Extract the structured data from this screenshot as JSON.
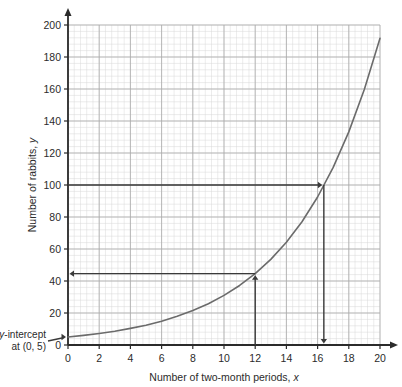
{
  "chart_data": {
    "type": "line",
    "title": "",
    "xlabel": "Number of two-month periods, x",
    "ylabel": "Number of rabbits, y",
    "xlim": [
      0,
      20
    ],
    "ylim": [
      0,
      200
    ],
    "grid": true,
    "minor_grid": true,
    "minor_divisions": 5,
    "legend": "none",
    "xticks": [
      0,
      2,
      4,
      6,
      8,
      10,
      12,
      14,
      16,
      18,
      20
    ],
    "yticks": [
      0,
      20,
      40,
      60,
      80,
      100,
      120,
      140,
      160,
      180,
      200
    ],
    "curve_color": "#6b6b6b",
    "annotation_color": "#3a3a3a",
    "series": [
      {
        "name": "Rabbit population",
        "equation": "y = 5(1.2)^x",
        "x": [
          0,
          1,
          2,
          3,
          4,
          5,
          6,
          7,
          8,
          9,
          10,
          11,
          12,
          13,
          14,
          15,
          16,
          17,
          18,
          19,
          20
        ],
        "values": [
          5,
          6,
          7.2,
          8.6,
          10.4,
          12.4,
          14.9,
          17.9,
          21.5,
          25.8,
          31,
          37.2,
          44.6,
          53.5,
          64.2,
          77,
          92.5,
          111,
          133.2,
          159.8,
          191.7
        ]
      }
    ],
    "annotations": [
      {
        "name": "y-intercept-callout",
        "text_line1": "y-intercept",
        "text_line2": "at (0, 5)",
        "points_to": [
          0,
          5
        ]
      },
      {
        "name": "read-up-from-12",
        "from": [
          12,
          0
        ],
        "to": [
          12,
          44.6
        ],
        "direction": "up",
        "then_to": [
          0,
          44.6
        ],
        "then_direction": "left"
      },
      {
        "name": "read-across-from-100",
        "from": [
          0,
          100
        ],
        "to": [
          16.4,
          100
        ],
        "direction": "right",
        "then_to": [
          16.4,
          0
        ],
        "then_direction": "down"
      }
    ]
  }
}
